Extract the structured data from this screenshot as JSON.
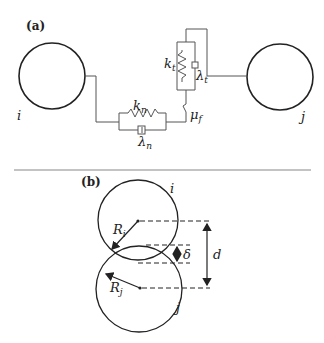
{
  "panels": {
    "a": {
      "label": "(a)",
      "particle_left": "i",
      "particle_right": "j",
      "normal_spring": {
        "symbol": "k",
        "subscript": "n"
      },
      "normal_damper": {
        "symbol": "λ",
        "subscript": "n"
      },
      "tangential_spring": {
        "symbol": "k",
        "subscript": "t"
      },
      "tangential_damper": {
        "symbol": "λ",
        "subscript": "t"
      },
      "friction_slider": {
        "symbol": "μ",
        "subscript": "f"
      }
    },
    "b": {
      "label": "(b)",
      "particle_top": "i",
      "particle_bottom": "j",
      "radius_top": {
        "symbol": "R",
        "subscript": "i"
      },
      "radius_bottom": {
        "symbol": "R",
        "subscript": "j"
      },
      "overlap": "δ",
      "distance": "d"
    }
  },
  "colors": {
    "line": "#222222",
    "wire": "#555555",
    "divider": "#888888"
  }
}
